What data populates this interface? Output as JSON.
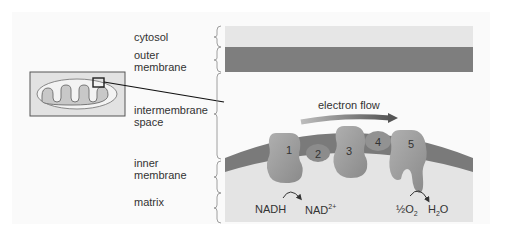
{
  "figure": {
    "regions": [
      {
        "id": "cytosol",
        "lines": [
          "cytosol"
        ],
        "color": "#e6e6e6"
      },
      {
        "id": "outer-membrane",
        "lines": [
          "outer",
          "membrane"
        ],
        "color": "#7d7d7d"
      },
      {
        "id": "intermembrane-space",
        "lines": [
          "intermembrane",
          "space"
        ],
        "color": "#fafafa"
      },
      {
        "id": "inner-membrane",
        "lines": [
          "inner",
          "membrane"
        ],
        "color": "#7a7a7a"
      },
      {
        "id": "matrix",
        "lines": [
          "matrix"
        ],
        "color": "#e4e4e4"
      }
    ],
    "complexes": [
      {
        "number": "1"
      },
      {
        "number": "2"
      },
      {
        "number": "3"
      },
      {
        "number": "4"
      },
      {
        "number": "5"
      }
    ],
    "arrow_label": "electron flow",
    "reactions": {
      "nadh": "NADH",
      "nad_base": "NAD",
      "nad_sup": "2+",
      "o2_half": "½O",
      "o2_sub": "2",
      "h2o_h": "H",
      "h2o_sub": "2",
      "h2o_o": "O"
    },
    "colors": {
      "protein": "#9a9a9a",
      "protein_dark": "#8a8a8a",
      "arrow_start": "#b0b0b0",
      "arrow_end": "#555555"
    }
  }
}
